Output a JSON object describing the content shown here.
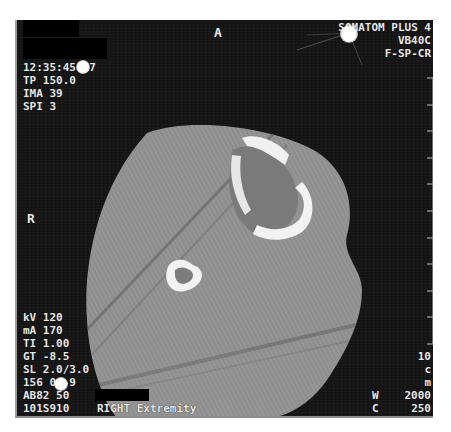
{
  "viewer": {
    "scanner_model": "SOMATOM PLUS 4",
    "software_version": "VB40C",
    "kernel": "F-SP-CR",
    "orientation_top": "A",
    "orientation_left": "R"
  },
  "top_left": {
    "time": "12:35:45.17",
    "tp": "TP 150.0",
    "ima": "IMA 39",
    "spi": "SPI 3"
  },
  "bottom_left": {
    "kv": "kV 120",
    "ma": "mA 170",
    "ti": "TI 1.00",
    "gt": "GT -8.5",
    "sl": "SL 2.0/3.0",
    "fov": "156 0/-9",
    "ab": "AB82 50",
    "series": "101S910",
    "body_part": "RIGHT Extremity"
  },
  "bottom_right": {
    "scale_value": "10",
    "scale_unit_1": "c",
    "scale_unit_2": "m",
    "window_label": "W",
    "window_value": "2000",
    "center_label": "C",
    "center_value": "250"
  },
  "colors": {
    "background": "#141414",
    "tissue": "#8e8e8e",
    "bone": "#f2f2f2",
    "text": "#e8e8e8"
  }
}
